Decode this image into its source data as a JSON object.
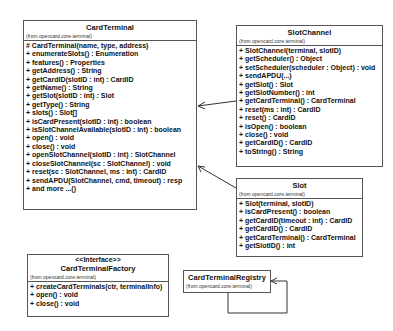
{
  "classes": {
    "card_terminal": {
      "name": "CardTerminal",
      "package": "(from opencard.core.terminal)",
      "operations": [
        "# CardTerminal(name, type, address)",
        "+ enumerateSlots() : Enumeration",
        "+ features() : Properties",
        "+ getAddress() : String",
        "+ getCardID(slotID : int) : CardID",
        "+ getName() : String",
        "+ getSlot(slotID : int) : Slot",
        "+ getType() : String",
        "+ slots() : Slot[]",
        "+ isCardPresent(slotID : int) : boolean",
        "+ isSlotChannelAvailable(slotID : int) : boolean",
        "+ open() : void",
        "+ close() : void",
        "+ openSlotChannel(slotID : int) : SlotChannel",
        "+ closeSlotChannel(sc : SlotChannel) : void",
        "+ reset(sc : SlotChannel, ms : int) : CardID",
        "+ sendAPDU(SlotChannel, cmd, timeout) : resp",
        "+ and more ...()"
      ]
    },
    "slot_channel": {
      "name": "SlotChannel",
      "package": "(from opencard.core.terminal)",
      "operations": [
        "+ SlotChannel(terminal, slotID)",
        "+ getScheduler() : Object",
        "+ setScheduler(scheduler : Object) : void",
        "+ sendAPDU(...)",
        "+ getSlot() : Slot",
        "+ getSlotNumber() : int",
        "+ getCardTerminal() : CardTerminal",
        "+ reset(ms : int) : CardID",
        "+ reset() : CardID",
        "+ isOpen() : boolean",
        "+ close() : void",
        "+ getCardID() : CardID",
        "+ toString() : String"
      ]
    },
    "slot": {
      "name": "Slot",
      "package": "(from opencard.core.terminal)",
      "operations": [
        "+ Slot(terminal, slotID)",
        "+ isCardPresent() : boolean",
        "+ getCardID(timeout : int) : CardID",
        "+ getCardID() : CardID",
        "+ getCardTerminal() : CardTerminal",
        "+ getSlotID() : int"
      ]
    },
    "card_terminal_factory": {
      "stereotype": "<<Interface>>",
      "name": "CardTerminalFactory",
      "package": "(from opencard.core.terminal)",
      "operations": [
        "+ createCardTerminals(ctr, terminalInfo)",
        "+ open() : void",
        "+ close() : void"
      ]
    },
    "card_terminal_registry": {
      "name": "CardTerminalRegistry",
      "package": "(from opencard.core.terminal)"
    }
  },
  "associations": [
    {
      "from": "SlotChannel",
      "to": "CardTerminal",
      "arrow": "open"
    },
    {
      "from": "Slot",
      "to": "CardTerminal",
      "arrow": "open"
    },
    {
      "from": "CardTerminalRegistry",
      "to": "CardTerminalRegistry",
      "arrow": "open",
      "self": true
    }
  ],
  "colors": {
    "line": "#555555",
    "background": "#ffffff"
  }
}
